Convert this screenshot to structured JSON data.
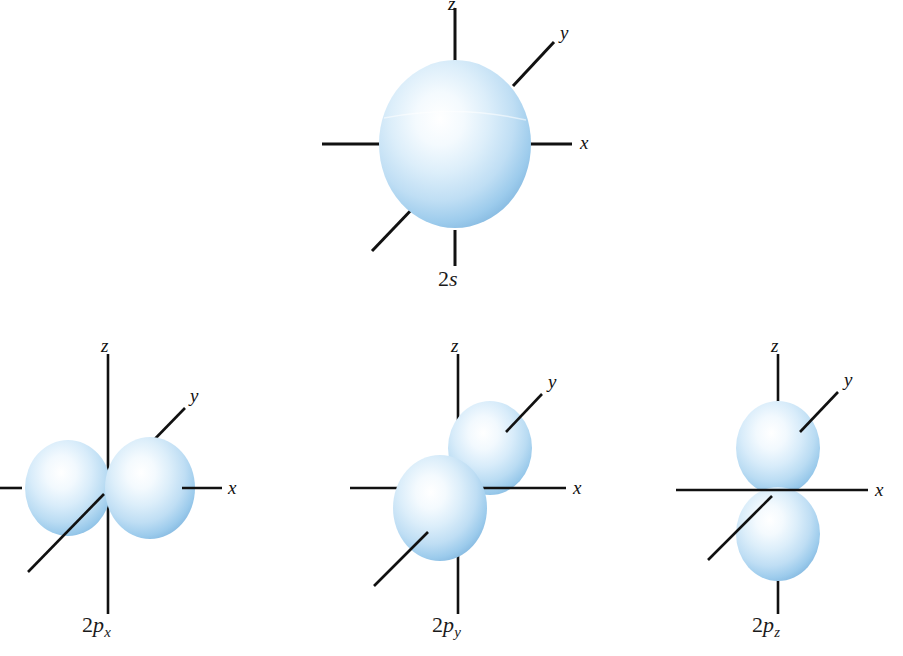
{
  "figure": {
    "background_color": "#ffffff",
    "axis_color": "#111111",
    "lobe_edge_color": "#7fb4dd",
    "lobe_mid_color": "#bcdcf3",
    "lobe_highlight_color": "#fbfdff"
  },
  "orbitals": [
    {
      "id": "2s",
      "name_number": "2",
      "name_symbol": "s",
      "name_subscript": "",
      "label": "2s",
      "shape": "sphere",
      "axes": {
        "z_label": "z",
        "y_label": "y",
        "x_label": "x"
      }
    },
    {
      "id": "2px",
      "name_number": "2",
      "name_symbol": "p",
      "name_subscript": "x",
      "label": "2px",
      "shape": "dumbbell-horizontal",
      "axes": {
        "z_label": "z",
        "y_label": "y",
        "x_label": "x"
      }
    },
    {
      "id": "2py",
      "name_number": "2",
      "name_symbol": "p",
      "name_subscript": "y",
      "label": "2py",
      "shape": "dumbbell-diagonal",
      "axes": {
        "z_label": "z",
        "y_label": "y",
        "x_label": "x"
      }
    },
    {
      "id": "2pz",
      "name_number": "2",
      "name_symbol": "p",
      "name_subscript": "z",
      "label": "2pz",
      "shape": "dumbbell-vertical",
      "axes": {
        "z_label": "z",
        "y_label": "y",
        "x_label": "x"
      }
    }
  ]
}
